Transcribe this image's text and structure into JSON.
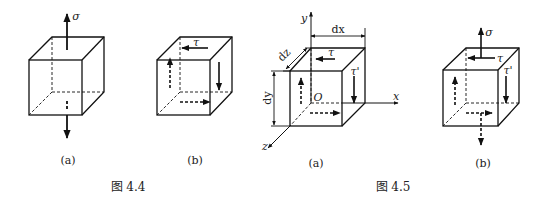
{
  "figures": [
    {
      "caption": "图 4.4",
      "panels": [
        {
          "label": "(a)",
          "stress": "σ",
          "description": "cube under normal stress σ (top and bottom)"
        },
        {
          "label": "(b)",
          "stress": "τ",
          "description": "cube under shear stress τ"
        }
      ]
    },
    {
      "caption": "图 4.5",
      "panels": [
        {
          "label": "(a)",
          "symbols": {
            "tau": "τ",
            "tau_prime": "τ'",
            "origin": "O",
            "x": "x",
            "y": "y",
            "z": "z",
            "dx": "dx",
            "dy": "dy",
            "dz": "dz"
          }
        },
        {
          "label": "(b)",
          "symbols": {
            "sigma": "σ",
            "tau": "τ",
            "tau_prime": "τ'"
          }
        }
      ]
    }
  ]
}
